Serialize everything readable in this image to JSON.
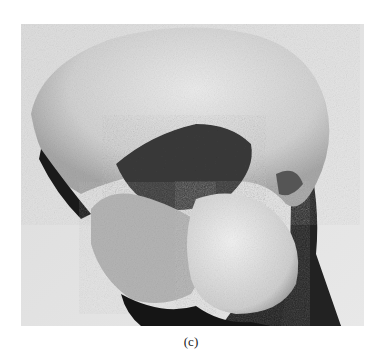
{
  "figure": {
    "caption": "(c)",
    "photo_description": "Grayscale photograph of a rounded rock/fossil specimen against a light background",
    "colors": {
      "background": "#d9d9d9",
      "specimen_light": "#e6e6e6",
      "specimen_mid": "#9a9a9a",
      "shadow": "#1a1a1a"
    }
  }
}
